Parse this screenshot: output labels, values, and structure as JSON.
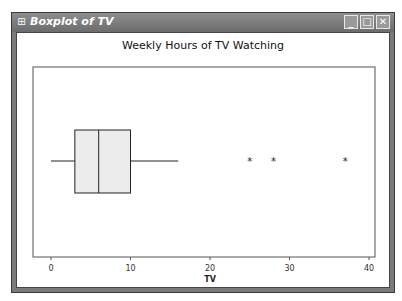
{
  "window": {
    "title": "Boxplot of TV",
    "icon": "grid-icon",
    "controls": [
      {
        "name": "minimize",
        "glyph": "_"
      },
      {
        "name": "maximize",
        "glyph": "□"
      },
      {
        "name": "close",
        "glyph": "✕"
      }
    ]
  },
  "chart_data": {
    "type": "boxplot",
    "title": "Weekly Hours of TV Watching",
    "xlabel": "TV",
    "ylabel": "",
    "orientation": "horizontal",
    "xlim": [
      -2.5,
      40.5
    ],
    "ticks": [
      0,
      10,
      20,
      30,
      40
    ],
    "tick_labels": [
      "0",
      "10",
      "20",
      "30",
      "40"
    ],
    "grid": false,
    "series": [
      {
        "name": "TV",
        "whisker_low": 0,
        "q1": 3,
        "median": 6,
        "q3": 10,
        "whisker_high": 16,
        "outliers": [
          25,
          28,
          37
        ]
      }
    ],
    "box_fill": "#ececec",
    "line_color": "#222222"
  }
}
